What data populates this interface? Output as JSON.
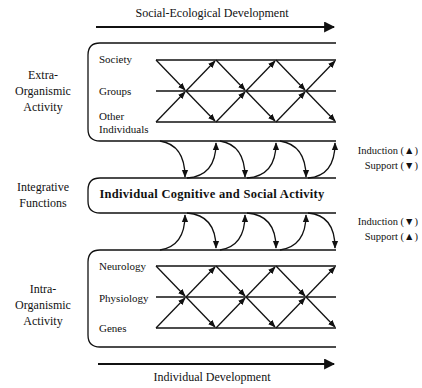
{
  "top_axis": {
    "label": "Social-Ecological Development",
    "direction": "right"
  },
  "bottom_axis": {
    "label": "Individual Development",
    "direction": "right"
  },
  "sections": [
    {
      "side_label": [
        "Extra-",
        "Organismic",
        "Activity"
      ],
      "levels": [
        "Society",
        "Groups",
        "Other",
        "Individuals"
      ]
    },
    {
      "side_label": [
        "Integrative",
        "Functions"
      ],
      "center_label": "Individual Cognitive and Social Activity"
    },
    {
      "side_label": [
        "Intra-",
        "Organismic",
        "Activity"
      ],
      "levels": [
        "Neurology",
        "Physiology",
        "Genes"
      ]
    }
  ],
  "legend_upper": {
    "induction": "Induction (▲)",
    "support": "Support (▼)"
  },
  "legend_lower": {
    "induction": "Induction (▼)",
    "support": "Support (▲)"
  },
  "colors": {
    "line": "#111111",
    "background": "#ffffff"
  }
}
